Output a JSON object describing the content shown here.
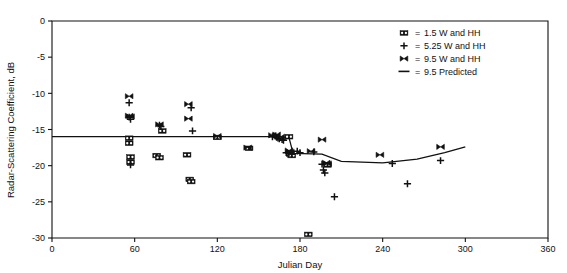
{
  "chart_data": {
    "type": "scatter",
    "title": "",
    "xlabel": "Julian Day",
    "ylabel": "Radar-Scattering Coefficient, dB",
    "xlim": [
      0,
      360
    ],
    "ylim": [
      -30,
      0
    ],
    "xticks": [
      0,
      60,
      120,
      180,
      240,
      300,
      360
    ],
    "yticks": [
      0,
      -5,
      -10,
      -15,
      -20,
      -25,
      -30
    ],
    "xtick_labels": [
      "0",
      "60",
      "120",
      "180",
      "240",
      "300",
      "360"
    ],
    "ytick_labels": [
      "0",
      "-5",
      "-10",
      "-15",
      "-20",
      "-25",
      "-30"
    ],
    "grid": false,
    "legend_position": "top-right",
    "series": [
      {
        "name": "1.5 W and HH",
        "marker": "bowtie-open",
        "points": [
          [
            56,
            -16.2
          ],
          [
            56,
            -16.9
          ],
          [
            57,
            -18.8
          ],
          [
            57,
            -19.5
          ],
          [
            76,
            -18.6
          ],
          [
            78,
            -18.9
          ],
          [
            80,
            -15.2
          ],
          [
            98,
            -18.5
          ],
          [
            100,
            -21.9
          ],
          [
            101,
            -22.2
          ],
          [
            120,
            -16.1
          ],
          [
            143,
            -17.6
          ],
          [
            172,
            -16.0
          ],
          [
            173,
            -18.4
          ],
          [
            174,
            -18.6
          ],
          [
            186,
            -29.5
          ],
          [
            200,
            -19.9
          ]
        ]
      },
      {
        "name": "5.25 W and HH",
        "marker": "plus",
        "points": [
          [
            56,
            -11.3
          ],
          [
            56,
            -13.3
          ],
          [
            57,
            -13.6
          ],
          [
            57,
            -19.9
          ],
          [
            78,
            -14.4
          ],
          [
            79,
            -14.6
          ],
          [
            101,
            -12.0
          ],
          [
            102,
            -15.2
          ],
          [
            160,
            -16.0
          ],
          [
            162,
            -15.9
          ],
          [
            163,
            -16.1
          ],
          [
            164,
            -16.2
          ],
          [
            165,
            -16.3
          ],
          [
            167,
            -16.4
          ],
          [
            168,
            -16.5
          ],
          [
            170,
            -18.2
          ],
          [
            172,
            -18.3
          ],
          [
            174,
            -18.4
          ],
          [
            178,
            -18.0
          ],
          [
            180,
            -18.2
          ],
          [
            190,
            -18.1
          ],
          [
            196,
            -19.8
          ],
          [
            197,
            -20.6
          ],
          [
            198,
            -21.0
          ],
          [
            205,
            -24.3
          ],
          [
            247,
            -19.7
          ],
          [
            258,
            -22.5
          ],
          [
            282,
            -19.3
          ]
        ]
      },
      {
        "name": "9.5 W and HH",
        "marker": "bowtie-filled",
        "points": [
          [
            56,
            -10.4
          ],
          [
            56,
            -13.1
          ],
          [
            57,
            -13.2
          ],
          [
            78,
            -14.3
          ],
          [
            99,
            -11.5
          ],
          [
            99,
            -13.5
          ],
          [
            120,
            -15.9
          ],
          [
            142,
            -17.5
          ],
          [
            160,
            -15.8
          ],
          [
            163,
            -15.7
          ],
          [
            166,
            -16.0
          ],
          [
            172,
            -17.9
          ],
          [
            173,
            -18.1
          ],
          [
            188,
            -18.0
          ],
          [
            196,
            -16.4
          ],
          [
            199,
            -19.6
          ],
          [
            200,
            -19.7
          ],
          [
            238,
            -18.5
          ],
          [
            282,
            -17.4
          ]
        ]
      }
    ],
    "predicted": {
      "name": "9.5 Predicted",
      "style": "line",
      "points": [
        [
          52,
          -16.0
        ],
        [
          80,
          -16.0
        ],
        [
          120,
          -16.0
        ],
        [
          160,
          -16.0
        ],
        [
          172,
          -16.1
        ],
        [
          175,
          -18.3
        ],
        [
          196,
          -18.4
        ],
        [
          210,
          -19.4
        ],
        [
          240,
          -19.6
        ],
        [
          265,
          -19.1
        ],
        [
          285,
          -18.2
        ],
        [
          300,
          -17.4
        ]
      ]
    }
  },
  "legend": {
    "equals": "=",
    "entries": [
      {
        "symbol": "bowtie-open",
        "label": "1.5 W and HH"
      },
      {
        "symbol": "plus",
        "label": "5.25 W and HH"
      },
      {
        "symbol": "bowtie-filled",
        "label": "9.5 W and HH"
      },
      {
        "symbol": "line",
        "label": "9.5 Predicted"
      }
    ]
  }
}
